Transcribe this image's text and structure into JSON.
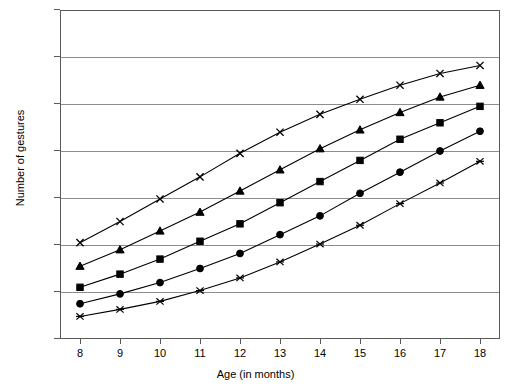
{
  "chart_data": {
    "type": "line",
    "title": "",
    "xlabel": "Age (in months)",
    "ylabel": "Number of gestures",
    "x": [
      8,
      9,
      10,
      11,
      12,
      13,
      14,
      15,
      16,
      17,
      18
    ],
    "xtick_labels": [
      "8",
      "9",
      "10",
      "11",
      "12",
      "13",
      "14",
      "15",
      "16",
      "17",
      "18"
    ],
    "ytick_labels": [
      "0",
      "10",
      "20",
      "30",
      "40",
      "50",
      "60",
      "70"
    ],
    "ytick_values": [
      0,
      10,
      20,
      30,
      40,
      50,
      60,
      70
    ],
    "xlim": [
      7.5,
      18.5
    ],
    "ylim": [
      0,
      70
    ],
    "grid": "horizontal",
    "legend": "none",
    "line_color": "#000000",
    "grid_color": "#8d8d8d",
    "axis_color": "#5a5a5a",
    "background": "#ffffff",
    "series": [
      {
        "name": "series-1",
        "marker": "cross",
        "values": [
          20.5,
          25.0,
          29.8,
          34.5,
          39.5,
          44.0,
          47.8,
          51.0,
          54.0,
          56.5,
          58.2
        ]
      },
      {
        "name": "series-2",
        "marker": "triangle",
        "values": [
          15.5,
          19.0,
          23.0,
          27.0,
          31.5,
          36.0,
          40.5,
          44.5,
          48.2,
          51.5,
          54.0
        ]
      },
      {
        "name": "series-3",
        "marker": "square",
        "values": [
          11.0,
          13.8,
          17.0,
          20.8,
          24.5,
          29.0,
          33.5,
          38.0,
          42.5,
          46.0,
          49.5
        ]
      },
      {
        "name": "series-4",
        "marker": "circle",
        "values": [
          7.5,
          9.6,
          12.0,
          15.0,
          18.2,
          22.2,
          26.2,
          31.0,
          35.5,
          40.0,
          44.2
        ]
      },
      {
        "name": "series-5",
        "marker": "asterisk",
        "values": [
          4.8,
          6.3,
          8.0,
          10.3,
          13.0,
          16.4,
          20.2,
          24.2,
          28.8,
          33.2,
          37.8
        ]
      }
    ]
  }
}
